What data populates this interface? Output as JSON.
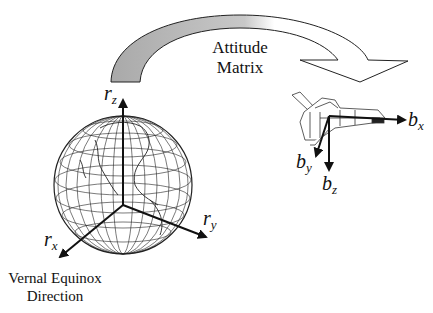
{
  "diagram": {
    "transform_label": {
      "line1": "Attitude",
      "line2": "Matrix"
    },
    "reference_frame": {
      "name": "Earth inertial frame",
      "axes": {
        "z": {
          "base": "r",
          "sub": "z"
        },
        "y": {
          "base": "r",
          "sub": "y"
        },
        "x": {
          "base": "r",
          "sub": "x"
        }
      },
      "caption": {
        "line1": "Vernal Equinox",
        "line2": "Direction"
      }
    },
    "body_frame": {
      "name": "Spacecraft body frame",
      "axes": {
        "x": {
          "base": "b",
          "sub": "x"
        },
        "y": {
          "base": "b",
          "sub": "y"
        },
        "z": {
          "base": "b",
          "sub": "z"
        }
      }
    },
    "colors": {
      "arrow_fill_shaded": "#b8b8b8",
      "line": "#111111",
      "background": "#ffffff"
    }
  }
}
